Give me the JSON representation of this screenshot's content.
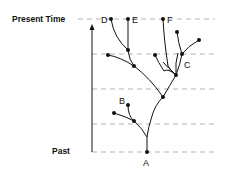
{
  "axis": {
    "top_label": "Present Time",
    "bottom_label": "Past"
  },
  "nodes": {
    "A": "A",
    "B": "B",
    "C": "C",
    "D": "D",
    "E": "E",
    "F": "F"
  },
  "colors": {
    "line": "#111111",
    "dash": "#aaaaaa"
  }
}
